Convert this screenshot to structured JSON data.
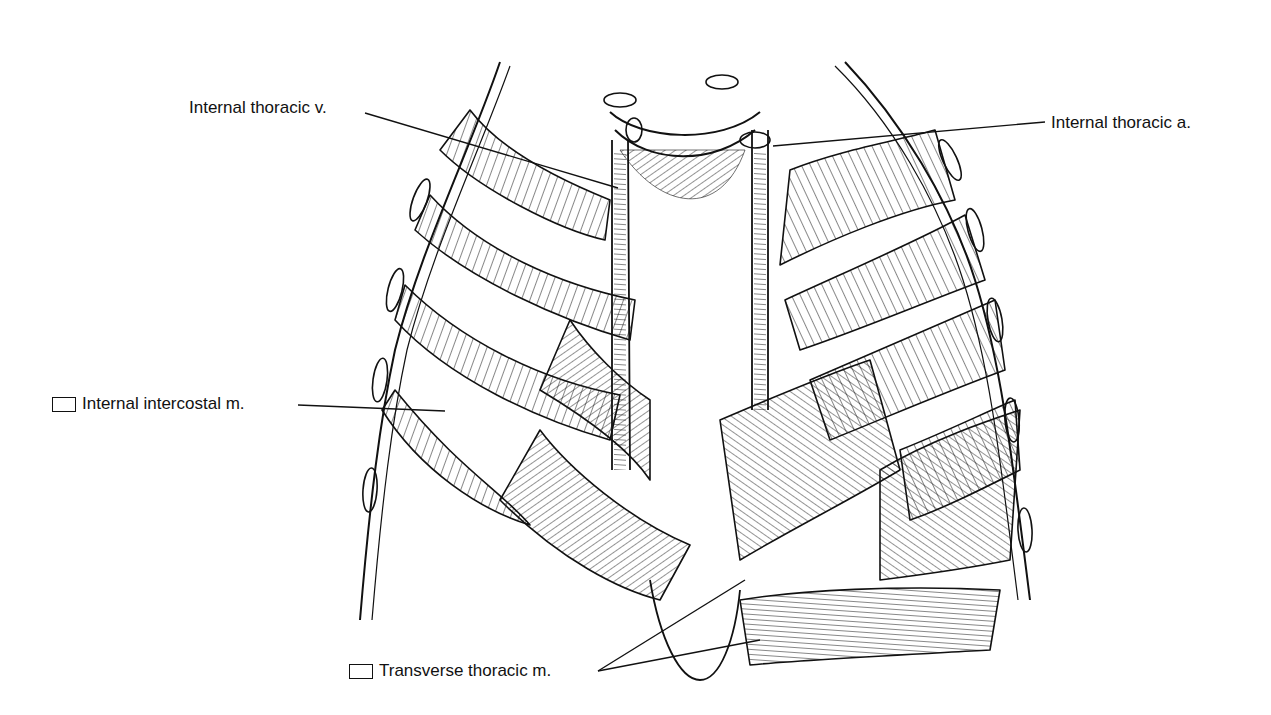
{
  "figure": {
    "labels": [
      {
        "id": "internal-thoracic-v",
        "text": "Internal thoracic v.",
        "has_checkbox": false
      },
      {
        "id": "internal-thoracic-a",
        "text": "Internal thoracic a.",
        "has_checkbox": false
      },
      {
        "id": "internal-intercostal-m",
        "text": "Internal intercostal m.",
        "has_checkbox": true
      },
      {
        "id": "transverse-thoracic-m",
        "text": "Transverse thoracic m.",
        "has_checkbox": true
      }
    ]
  },
  "colors": {
    "ink": "#111111",
    "paper": "#ffffff"
  }
}
